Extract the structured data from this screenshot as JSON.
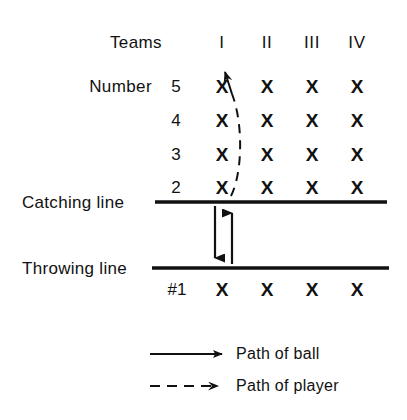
{
  "diagram": {
    "background_color": "#ffffff",
    "ink_color": "#111111",
    "headers": {
      "teams_label": "Teams",
      "number_label": "Number",
      "columns": [
        "I",
        "II",
        "III",
        "IV"
      ]
    },
    "rows": [
      {
        "number": "5",
        "marks": [
          "X",
          "X",
          "X",
          "X"
        ]
      },
      {
        "number": "4",
        "marks": [
          "X",
          "X",
          "X",
          "X"
        ]
      },
      {
        "number": "3",
        "marks": [
          "X",
          "X",
          "X",
          "X"
        ]
      },
      {
        "number": "2",
        "marks": [
          "X",
          "X",
          "X",
          "X"
        ]
      }
    ],
    "front_row": {
      "number": "#1",
      "marks": [
        "X",
        "X",
        "X",
        "X"
      ]
    },
    "lines": [
      {
        "name": "catching-line",
        "label": "Catching line"
      },
      {
        "name": "throwing-line",
        "label": "Throwing line"
      }
    ],
    "legend": [
      {
        "style": "solid",
        "label": "Path of ball"
      },
      {
        "style": "dashed",
        "label": "Path of player"
      }
    ]
  }
}
